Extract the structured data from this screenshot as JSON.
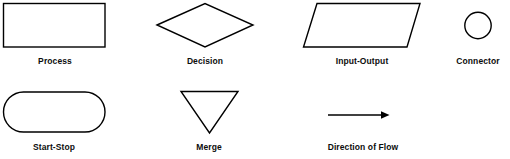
{
  "diagram": {
    "background_color": "#ffffff",
    "stroke_color": "#000000",
    "label_color": "#0d0d0d",
    "symbols": [
      {
        "name": "process",
        "label": "Process",
        "shape": "rectangle",
        "label_x": 55,
        "label_y": 64
      },
      {
        "name": "decision",
        "label": "Decision",
        "shape": "diamond",
        "label_x": 205,
        "label_y": 64
      },
      {
        "name": "input-output",
        "label": "Input-Output",
        "shape": "parallelogram",
        "label_x": 362,
        "label_y": 64
      },
      {
        "name": "connector",
        "label": "Connector",
        "shape": "circle",
        "label_x": 478,
        "label_y": 64
      },
      {
        "name": "start-stop",
        "label": "Start-Stop",
        "shape": "stadium",
        "label_x": 54,
        "label_y": 150
      },
      {
        "name": "merge",
        "label": "Merge",
        "shape": "inverted-triangle",
        "label_x": 209,
        "label_y": 150
      },
      {
        "name": "direction-of-flow",
        "label": "Direction of Flow",
        "shape": "arrow",
        "label_x": 363,
        "label_y": 150
      }
    ]
  }
}
